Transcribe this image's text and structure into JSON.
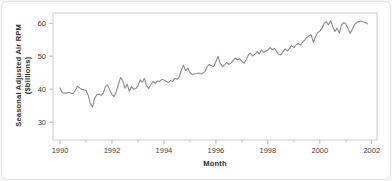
{
  "window": {
    "background": "#ffffff",
    "border_color": "#e2e2e2"
  },
  "chart_data": {
    "type": "line",
    "title": "",
    "xlabel": "Month",
    "ylabel_line1": "Seasonal Adjusted Air RPM",
    "ylabel_line2": "($billions)",
    "x_ticks": [
      1990,
      1992,
      1994,
      1996,
      1998,
      2000,
      2002
    ],
    "x_minor_ticks": [
      1991,
      1993,
      1995,
      1997,
      1999,
      2001
    ],
    "y_ticks": [
      30,
      40,
      50,
      60
    ],
    "xlim": [
      1989.73,
      2002.2
    ],
    "ylim": [
      24.6,
      63.1
    ],
    "grid": false,
    "legend_position": "none",
    "line_color": "#8a8a8a",
    "axis_color": "#cccccc",
    "tick_color": "#b5b5b5",
    "tick_label_color": "#3d3d3d",
    "x_start_year": 1990,
    "x_step_months": 1,
    "series": [
      {
        "name": "Seasonal Adjusted Air RPM ($billions)",
        "values": [
          40.4,
          39.0,
          38.8,
          38.8,
          39.1,
          38.8,
          38.7,
          39.5,
          40.9,
          40.4,
          40.0,
          39.8,
          39.7,
          38.2,
          35.7,
          34.6,
          37.3,
          38.3,
          38.5,
          38.1,
          38.8,
          40.8,
          41.3,
          39.8,
          38.3,
          37.8,
          39.3,
          41.5,
          43.6,
          42.5,
          40.3,
          41.5,
          39.4,
          40.8,
          40.0,
          40.2,
          41.0,
          42.8,
          42.1,
          43.3,
          41.0,
          40.2,
          41.5,
          42.3,
          41.8,
          42.5,
          42.3,
          43.0,
          42.8,
          42.4,
          42.0,
          42.6,
          42.3,
          43.3,
          43.0,
          43.6,
          45.8,
          47.3,
          45.6,
          46.4,
          45.0,
          44.4,
          44.6,
          44.7,
          44.9,
          44.6,
          44.9,
          45.4,
          46.9,
          47.5,
          47.1,
          46.9,
          48.4,
          50.0,
          47.9,
          46.8,
          47.4,
          48.1,
          47.5,
          47.9,
          48.7,
          49.4,
          48.9,
          49.2,
          48.4,
          47.9,
          49.0,
          50.4,
          50.9,
          50.1,
          50.6,
          51.4,
          50.7,
          51.9,
          51.1,
          51.6,
          51.9,
          52.6,
          51.9,
          52.4,
          51.4,
          50.6,
          50.4,
          51.4,
          52.2,
          51.6,
          52.4,
          53.2,
          52.6,
          53.4,
          53.9,
          53.4,
          54.2,
          54.9,
          55.6,
          56.2,
          56.5,
          54.2,
          55.9,
          57.2,
          57.6,
          58.5,
          60.0,
          60.5,
          59.5,
          60.8,
          59.0,
          57.5,
          58.5,
          57.0,
          59.5,
          60.2,
          59.8,
          58.5,
          56.9,
          58.2,
          59.5,
          60.2,
          60.5,
          60.7,
          60.4,
          60.2,
          59.8
        ]
      }
    ]
  }
}
